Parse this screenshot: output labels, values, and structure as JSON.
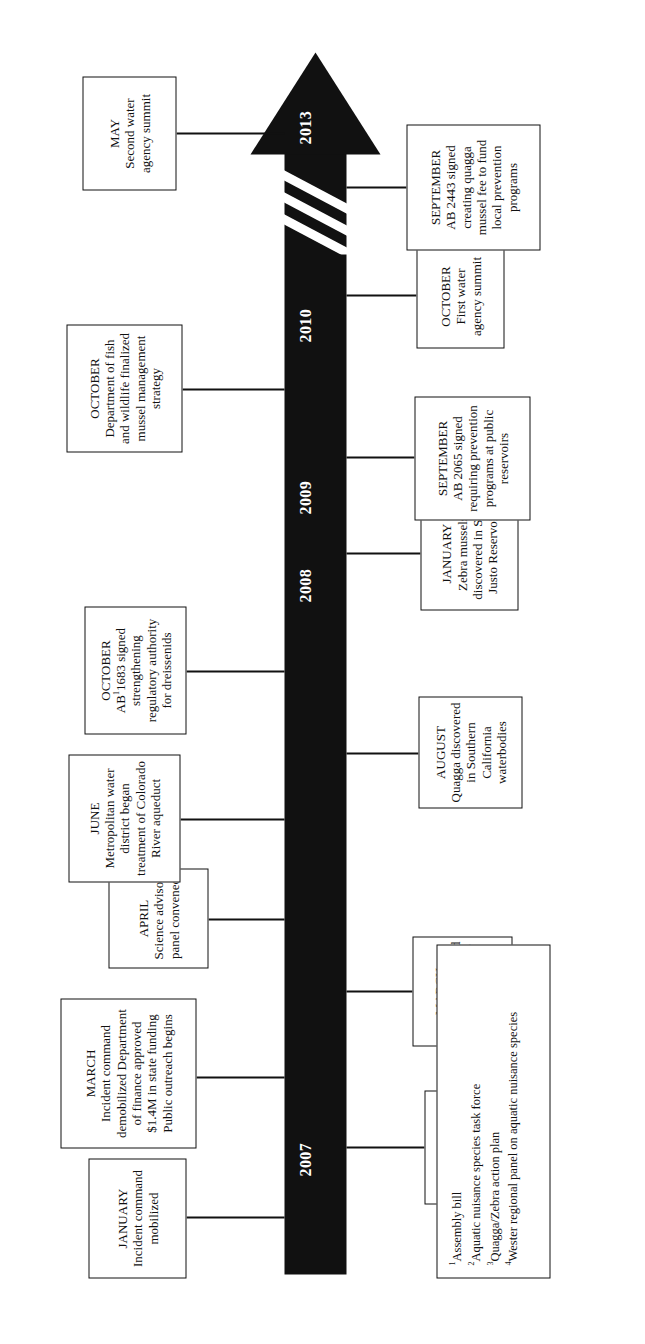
{
  "figure": {
    "kind": "timeline-arrow-infographic",
    "orientation": "rotated-90-counterclockwise",
    "arrow_color": "#111111",
    "background_color": "#ffffff",
    "direction": "increasing time toward arrowhead"
  },
  "years": [
    {
      "label": "2007"
    },
    {
      "label": "2008"
    },
    {
      "label": "2009"
    },
    {
      "label": "2010"
    },
    {
      "label": "2013"
    }
  ],
  "events": [
    {
      "id": "jan-2007-quagga-lower-colorado",
      "month": "JANUARY",
      "body": "Quagga discovered in lower Colorado River",
      "side": "below"
    },
    {
      "id": "jan-2007-incident-command-mobilized",
      "month": "JANUARY",
      "body": "Incident command mobilized",
      "side": "above"
    },
    {
      "id": "mar-2007-incident-command-demobilized",
      "month": "MARCH",
      "body": "Incident command demobilized Department of finance approved $1.4M in state funding Public outreach begins",
      "side": "above"
    },
    {
      "id": "mar-2007-quagga-colorado-river-aqueduct",
      "month": "MARCH",
      "body": "Quagga discovered in Colorado River aqueduct",
      "side": "below"
    },
    {
      "id": "apr-2007-science-advisor-panel",
      "month": "APRIL",
      "body": "Science advisor panel convened",
      "side": "above"
    },
    {
      "id": "jun-2007-metropolitan-water-district",
      "month": "JUNE",
      "body": "Metropolitan water district began treatment of Colorado River aqueduct",
      "side": "above"
    },
    {
      "id": "aug-2007-quagga-southern-california",
      "month": "AUGUST",
      "body": "Quagga discovered in Southern California waterbodies",
      "side": "below"
    },
    {
      "id": "oct-2007-ab1683",
      "month": "OCTOBER",
      "body_pre": "AB",
      "body_sup": "1",
      "body_post": "1683 signed strengthening regulatory authority for dreissenids",
      "side": "above"
    },
    {
      "id": "jan-2008-zebra-san-justo",
      "month": "JANUARY",
      "body": "Zebra mussels discovered in San Justo Reservoir",
      "side": "below"
    },
    {
      "id": "sep-2009-ab2065",
      "month": "SEPTEMBER",
      "body": "AB 2065 signed requiring prevention programs at public reservoirs",
      "side": "below"
    },
    {
      "id": "oct-2009-dfw-mussel-strategy",
      "month": "OCTOBER",
      "body": "Department of fish and wildlife finalized mussel management strategy",
      "side": "above"
    },
    {
      "id": "oct-2010-first-water-agency-summit",
      "month": "OCTOBER",
      "body": "First water agency summit",
      "side": "below"
    },
    {
      "id": "sep-2013-ab2443",
      "month": "SEPTEMBER",
      "body": "AB 2443 signed creating quagga mussel fee to fund local prevention programs",
      "side": "below"
    },
    {
      "id": "may-2013-second-water-agency-summit",
      "month": "MAY",
      "body": "Second water agency summit",
      "side": "above"
    }
  ],
  "footnotes": [
    {
      "marker": "1",
      "text": "Assembly bill"
    },
    {
      "marker": "2",
      "text": "Aquatic nuisance species task force"
    },
    {
      "marker": "3",
      "text": "Quagga/Zebra action plan"
    },
    {
      "marker": "4",
      "text": "Wester regional panel on aquatic nuisance species"
    }
  ]
}
